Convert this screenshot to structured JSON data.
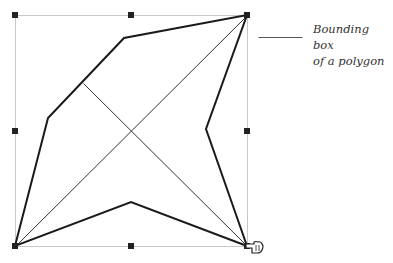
{
  "caption": {
    "line1": "Bounding box",
    "line2": "of a polygon"
  },
  "colors": {
    "bbox": "#c8c8c8",
    "polygon": "#1a1a1a",
    "handle": "#222222",
    "diagonal": "#333333",
    "leader": "#555555"
  },
  "bounding_box": {
    "x": 15,
    "y": 15,
    "width": 232,
    "height": 231
  },
  "handles": [
    {
      "x": 15,
      "y": 15
    },
    {
      "x": 131,
      "y": 15
    },
    {
      "x": 247,
      "y": 15
    },
    {
      "x": 15,
      "y": 131
    },
    {
      "x": 247,
      "y": 131
    },
    {
      "x": 15,
      "y": 246
    },
    {
      "x": 131,
      "y": 246
    },
    {
      "x": 247,
      "y": 246
    }
  ],
  "polygon_points": "15,246 48,118 124,38 247,15 206,129 247,246 131,202",
  "diagonals": [
    {
      "x1": 15,
      "y1": 246,
      "x2": 247,
      "y2": 15
    },
    {
      "x1": 83,
      "y1": 83,
      "x2": 247,
      "y2": 246
    }
  ],
  "leader_line": {
    "x1": 258,
    "y1": 37,
    "x2": 302,
    "y2": 37
  },
  "cursor": "pointing-hand-icon"
}
